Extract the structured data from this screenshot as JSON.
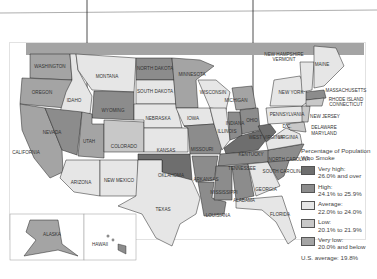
{
  "map": {
    "title": "Percentage of Population Who Smoke",
    "us_average": "U.S. average: 19.8%",
    "colors": {
      "very_high": "#6e6e6e",
      "high": "#8c8c8c",
      "average": "#e6e6e6",
      "low": "#c8c8c8",
      "very_low": "#a4a4a4",
      "water": "#ffffff",
      "border": "#222222"
    },
    "legend": [
      {
        "key": "very_high",
        "label": "Very high:",
        "range": "26.0% and over"
      },
      {
        "key": "high",
        "label": "High:",
        "range": "24.1% to 25.9%"
      },
      {
        "key": "average",
        "label": "Average:",
        "range": "22.0% to 24.0%"
      },
      {
        "key": "low",
        "label": "Low:",
        "range": "20.1% to 21.9%"
      },
      {
        "key": "very_low",
        "label": "Very low:",
        "range": "20.0% and below"
      }
    ],
    "labels": {
      "washington": "WASHINGTON",
      "oregon": "OREGON",
      "california": "CALIFORNIA",
      "idaho": "IDAHO",
      "nevada": "NEVADA",
      "montana": "MONTANA",
      "wyoming": "WYOMING",
      "utah": "UTAH",
      "colorado": "COLORADO",
      "arizona": "ARIZONA",
      "new_mexico": "NEW MEXICO",
      "north_dakota": "NORTH DAKOTA",
      "south_dakota": "SOUTH DAKOTA",
      "nebraska": "NEBRASKA",
      "kansas": "KANSAS",
      "oklahoma": "OKLAHOMA",
      "texas": "TEXAS",
      "minnesota": "MINNESOTA",
      "iowa": "IOWA",
      "missouri": "MISSOURI",
      "arkansas": "ARKANSAS",
      "louisiana": "LOUISIANA",
      "wisconsin": "WISCONSIN",
      "illinois": "ILLINOIS",
      "michigan": "MICHIGAN",
      "indiana": "INDIANA",
      "ohio": "OHIO",
      "kentucky": "KENTUCKY",
      "tennessee": "TENNESSEE",
      "mississippi": "MISSISSIPPI",
      "alabama": "ALABAMA",
      "georgia": "GEORGIA",
      "florida": "FLORIDA",
      "south_carolina": "SOUTH CAROLINA",
      "north_carolina": "NORTH CAROLINA",
      "virginia": "VIRGINIA",
      "west_virginia": "WEST VIRGINIA",
      "pennsylvania": "PENNSYLVANIA",
      "new_york": "NEW YORK",
      "new_jersey": "NEW JERSEY",
      "delaware": "DELAWARE",
      "maryland": "MARYLAND",
      "dc": "D.C.",
      "massachusetts": "MASSACHUSETTS",
      "rhode_island": "RHODE ISLAND",
      "connecticut": "CONNECTICUT",
      "maine": "MAINE",
      "new_hampshire": "NEW HAMPSHIRE",
      "vermont": "VERMONT",
      "alaska": "ALASKA",
      "hawaii": "HAWAII"
    }
  }
}
